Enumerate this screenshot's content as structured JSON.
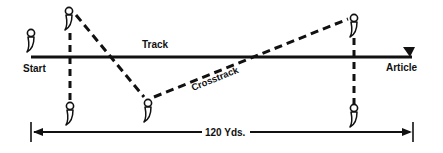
{
  "diagram": {
    "labels": {
      "start": "Start",
      "track": "Track",
      "article": "Article",
      "crosstrack": "Crosstrack",
      "distance": "120 Yds."
    },
    "colors": {
      "ink": "#111111",
      "background": "#ffffff"
    },
    "figures": [
      {
        "id": "start-figure",
        "x": 31,
        "y": 34
      },
      {
        "id": "top-left-figure",
        "x": 69,
        "y": 11
      },
      {
        "id": "bottom-left-figure",
        "x": 69,
        "y": 104
      },
      {
        "id": "bottom-middle-figure",
        "x": 148,
        "y": 101
      },
      {
        "id": "top-right-figure",
        "x": 353,
        "y": 17
      },
      {
        "id": "bottom-right-figure",
        "x": 353,
        "y": 108
      }
    ],
    "icon_semantic": "person-standing-icon"
  }
}
